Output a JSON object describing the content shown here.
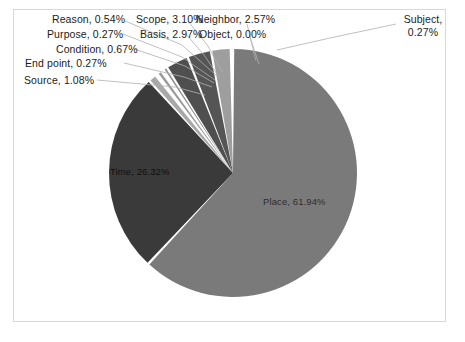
{
  "chart_data": {
    "type": "pie",
    "title": "",
    "subtitle": "",
    "xlabel": "",
    "ylabel": "",
    "legend_position": "none",
    "grid": false,
    "start_angle_deg": 0,
    "direction": "clockwise",
    "categories": [
      "Place",
      "Time",
      "Scope",
      "Basis",
      "Neighbor",
      "Source",
      "Condition",
      "Reason",
      "Purpose",
      "End point",
      "Subject",
      "Object"
    ],
    "values": [
      61.94,
      26.32,
      3.1,
      2.97,
      2.57,
      1.08,
      0.67,
      0.54,
      0.27,
      0.27,
      0.27,
      0.0
    ],
    "unit": "%",
    "slices": [
      {
        "name": "Place",
        "value": 61.94,
        "label": "Place, 61.94%",
        "color": "#7a7a7a"
      },
      {
        "name": "Time",
        "value": 26.32,
        "label": "Time, 26.32%",
        "color": "#3a3a3a"
      },
      {
        "name": "Source",
        "value": 1.08,
        "label": "Source, 1.08%",
        "color": "#a8a8a8"
      },
      {
        "name": "End point",
        "value": 0.27,
        "label": "End point, 0.27%",
        "color": "#585858"
      },
      {
        "name": "Condition",
        "value": 0.67,
        "label": "Condition, 0.67%",
        "color": "#9a9a9a"
      },
      {
        "name": "Purpose",
        "value": 0.27,
        "label": "Purpose, 0.27%",
        "color": "#4a4a4a"
      },
      {
        "name": "Reason",
        "value": 0.54,
        "label": "Reason, 0.54%",
        "color": "#8d8d8d"
      },
      {
        "name": "Basis",
        "value": 2.97,
        "label": "Basis, 2.97%",
        "color": "#4f4f4f"
      },
      {
        "name": "Scope",
        "value": 3.1,
        "label": "Scope, 3.10%",
        "color": "#555555"
      },
      {
        "name": "Neighbor",
        "value": 2.57,
        "label": "Neighbor, 2.57%",
        "color": "#9e9e9e"
      },
      {
        "name": "Object",
        "value": 0.0,
        "label": "Object, 0.00%",
        "color": "#6d6d6d"
      },
      {
        "name": "Subject",
        "value": 0.27,
        "label": "Subject, 0.27%",
        "color": "#c4c4c4"
      }
    ]
  },
  "labels": {
    "reason": "Reason, 0.54%",
    "purpose": "Purpose, 0.27%",
    "condition": "Condition, 0.67%",
    "end_point": "End point, 0.27%",
    "source": "Source, 1.08%",
    "scope": "Scope, 3.10%",
    "basis": "Basis, 2.97%",
    "neighbor": "Neighbor, 2.57%",
    "object": "Object, 0.00%",
    "subject": "Subject, 0.27%",
    "time": "Time, 26.32%",
    "place": "Place, 61.94%"
  },
  "colors": {
    "frame_border": "#d8d8d8",
    "background": "#ffffff",
    "leader_line": "#b0b0b0",
    "slice_gap": "#ffffff",
    "place": "#7a7a7a",
    "time": "#3a3a3a"
  }
}
